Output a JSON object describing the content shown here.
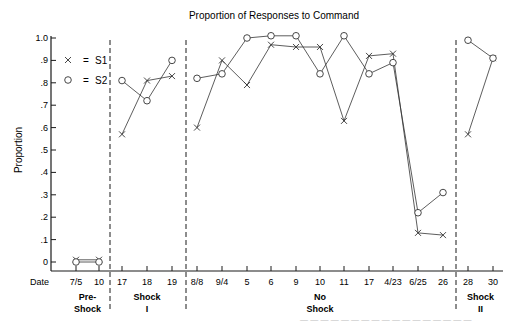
{
  "chart_data": {
    "type": "line",
    "title": "Proportion of Responses to Command",
    "xlabel": "Date",
    "ylabel": "Proportion",
    "ylim": [
      0,
      1.0
    ],
    "yticks": [
      "0",
      ".1",
      ".2",
      ".3",
      ".4",
      ".5",
      ".6",
      ".7",
      ".8",
      ".9",
      "1.0"
    ],
    "grid": false,
    "legend": {
      "position": "upper-left",
      "entries": [
        {
          "marker": "x",
          "label": "S1",
          "text": "×  =  S1"
        },
        {
          "marker": "o",
          "label": "S2",
          "text": "○  =  S2"
        }
      ]
    },
    "categories": [
      "7/5",
      "10",
      "17",
      "18",
      "19",
      "8/8",
      "9/4",
      "5",
      "6",
      "9",
      "10",
      "11",
      "17",
      "4/23",
      "6/25",
      "26",
      "28",
      "30"
    ],
    "phases": [
      {
        "label_line1": "Pre-",
        "label_line2": "Shock",
        "start": 0,
        "end": 1
      },
      {
        "label_line1": "Shock",
        "label_line2": "I",
        "start": 2,
        "end": 4
      },
      {
        "label_line1": "No",
        "label_line2": "Shock",
        "start": 5,
        "end": 15
      },
      {
        "label_line1": "Shock",
        "label_line2": "II",
        "start": 16,
        "end": 17
      }
    ],
    "series": [
      {
        "name": "S1",
        "marker": "x",
        "values": [
          0.01,
          0.01,
          0.57,
          0.81,
          0.83,
          0.6,
          0.9,
          0.79,
          0.97,
          0.96,
          0.96,
          0.63,
          0.92,
          0.93,
          0.13,
          0.12,
          0.57,
          0.91
        ]
      },
      {
        "name": "S2",
        "marker": "o",
        "values": [
          0.0,
          0.0,
          0.81,
          0.72,
          0.9,
          0.82,
          0.84,
          1.0,
          1.01,
          1.01,
          0.84,
          1.01,
          0.84,
          0.89,
          0.22,
          0.31,
          0.99,
          0.91
        ]
      }
    ]
  },
  "labels": {
    "title": "Proportion of Responses to Command",
    "ylabel": "Proportion",
    "xlabel": "Date",
    "legend_s1": "S1",
    "legend_s2": "S2",
    "legend_eq": "="
  }
}
